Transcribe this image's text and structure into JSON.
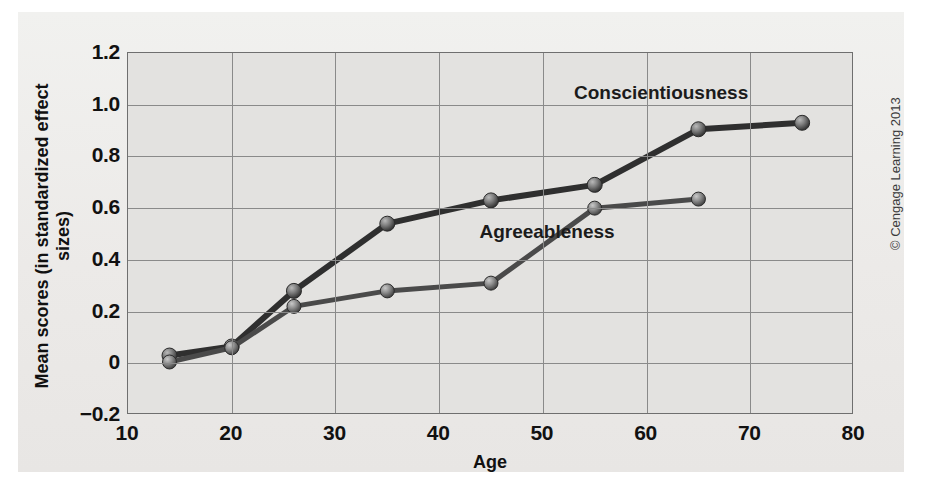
{
  "figure": {
    "credit": "© Cengage Learning 2013"
  },
  "chart_data": {
    "type": "line",
    "title": "",
    "xlabel": "Age",
    "ylabel": "Mean scores (in standardized effect sizes)",
    "xlim": [
      10,
      80
    ],
    "ylim": [
      -0.2,
      1.2
    ],
    "xticks": [
      10,
      20,
      30,
      40,
      50,
      60,
      70,
      80
    ],
    "xticklabels": [
      "10",
      "20",
      "30",
      "40",
      "50",
      "60",
      "70",
      "80"
    ],
    "yticks": [
      -0.2,
      0,
      0.2,
      0.4,
      0.6,
      0.8,
      1.0,
      1.2
    ],
    "yticklabels": [
      "−0.2",
      "0",
      "0.2",
      "0.4",
      "0.6",
      "0.8",
      "1.0",
      "1.2"
    ],
    "grid": true,
    "grid_axes": "both",
    "legend": "inline-labels",
    "marker": "sphere",
    "series": [
      {
        "name": "Conscientiousness",
        "color": "#2f2f2f",
        "label_x": 61.5,
        "label_y": 1.04,
        "x": [
          14,
          20,
          26,
          35,
          45,
          55,
          65,
          75
        ],
        "y": [
          0.03,
          0.065,
          0.28,
          0.54,
          0.63,
          0.69,
          0.905,
          0.93
        ]
      },
      {
        "name": "Agreeableness",
        "color": "#4a4a4a",
        "label_x": 50.5,
        "label_y": 0.505,
        "x": [
          14,
          20,
          26,
          35,
          45,
          55,
          65
        ],
        "y": [
          0.005,
          0.06,
          0.22,
          0.28,
          0.31,
          0.6,
          0.635
        ]
      }
    ]
  }
}
